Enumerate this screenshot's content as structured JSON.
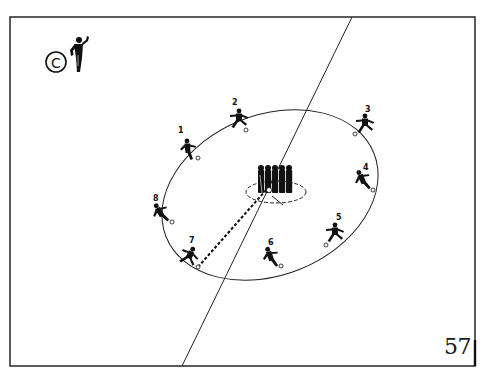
{
  "diagram": {
    "label": "C",
    "page_number": "57",
    "colors": {
      "ink": "#111111",
      "frame": "#333333",
      "background": "#ffffff"
    },
    "frame": {
      "x": 10,
      "y": 17,
      "width": 465,
      "height": 349
    },
    "diagonal_line": {
      "x1": 352,
      "y1": 17,
      "x2": 182,
      "y2": 366
    },
    "circuit_ellipse": {
      "cx": 270,
      "cy": 195,
      "rx": 112,
      "ry": 80,
      "rotate": -22
    },
    "wall": {
      "cx": 275,
      "cy": 181,
      "players": 5,
      "dashed_ellipse": {
        "cx": 276,
        "cy": 192,
        "rx": 30,
        "ry": 11
      }
    },
    "pass_line": {
      "x1": 198,
      "y1": 267,
      "x2": 266,
      "y2": 190,
      "style": "dashed"
    },
    "players": [
      {
        "number": "1",
        "x": 187,
        "y": 150,
        "ball": {
          "x": 198,
          "y": 158
        }
      },
      {
        "number": "2",
        "x": 238,
        "y": 118,
        "ball": {
          "x": 246,
          "y": 130
        }
      },
      {
        "number": "3",
        "x": 364,
        "y": 125,
        "ball": {
          "x": 355,
          "y": 134
        }
      },
      {
        "number": "4",
        "x": 362,
        "y": 180,
        "ball": {
          "x": 373,
          "y": 190
        }
      },
      {
        "number": "5",
        "x": 333,
        "y": 233,
        "ball": {
          "x": 326,
          "y": 245
        }
      },
      {
        "number": "6",
        "x": 270,
        "y": 257,
        "ball": {
          "x": 281,
          "y": 266
        }
      },
      {
        "number": "7",
        "x": 188,
        "y": 256,
        "ball": {
          "x": 198,
          "y": 267
        }
      },
      {
        "number": "8",
        "x": 160,
        "y": 213,
        "ball": {
          "x": 172,
          "y": 222
        }
      }
    ],
    "coach": {
      "x": 75,
      "y": 55
    }
  }
}
